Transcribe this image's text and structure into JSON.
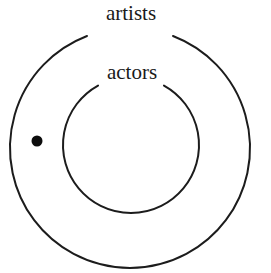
{
  "diagram": {
    "type": "euler-diagram",
    "background_color": "#ffffff",
    "stroke_color": "#1c1c1c",
    "text_color": "#1a1a1a",
    "dot_color": "#0d0d0d",
    "sets": [
      {
        "id": "artists",
        "label": "artists",
        "role": "outer-set",
        "center_x": 130,
        "center_y": 148,
        "radius": 120,
        "label_x": 131,
        "label_y": 20,
        "gap_start_deg": 249,
        "gap_end_deg": 291
      },
      {
        "id": "actors",
        "label": "actors",
        "role": "inner-set",
        "center_x": 131,
        "center_y": 145,
        "radius": 68,
        "label_x": 132,
        "label_y": 79,
        "gap_start_deg": 241,
        "gap_end_deg": 299
      }
    ],
    "points": [
      {
        "id": "element-1",
        "label": "",
        "x": 37,
        "y": 141,
        "radius": 5.5,
        "region": "artists-only"
      }
    ]
  }
}
